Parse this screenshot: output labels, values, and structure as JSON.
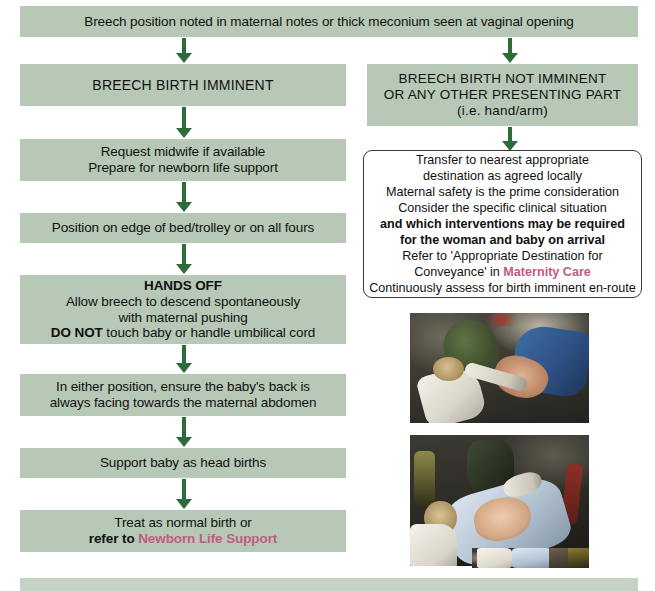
{
  "colors": {
    "box_fill": "#b7c9b6",
    "arrow": "#2f6b3a",
    "highlight_pink": "#bf5c84",
    "panel_border": "#3a3a3a",
    "text": "#101010"
  },
  "flow": {
    "start_box": {
      "lines": [
        "Breech position noted in maternal notes or thick meconium seen at vaginal opening"
      ]
    },
    "left_branch": {
      "header": {
        "lines": [
          "BREECH BIRTH IMMINENT"
        ]
      },
      "steps": [
        {
          "lines": [
            "Request midwife if available",
            "Prepare for newborn life support"
          ]
        },
        {
          "lines": [
            "Position on edge of bed/trolley or on all fours"
          ]
        },
        {
          "lines": [
            "HANDS OFF",
            "Allow breech to descend spontaneously",
            "with maternal pushing",
            "DO NOT touch baby or handle umbilical cord"
          ]
        },
        {
          "lines": [
            "In either position, ensure the baby's back is",
            "always facing towards the maternal abdomen"
          ]
        },
        {
          "lines": [
            "Support baby as head births"
          ]
        },
        {
          "lines": [
            "Treat as normal birth or",
            "refer to Newborn Life Support"
          ]
        }
      ],
      "hands_off_bold": "HANDS OFF",
      "do_not_bold": "DO NOT",
      "refer_to_bold": "refer to",
      "newborn_life_support_link": "Newborn Life Support"
    },
    "right_branch": {
      "header": {
        "lines": [
          "BREECH BIRTH NOT IMMINENT",
          "OR ANY OTHER PRESENTING PART",
          "(i.e. hand/arm)"
        ]
      },
      "advisory_panel": {
        "lines": [
          "Transfer to nearest appropriate",
          "destination as agreed locally",
          "Maternal safety is the prime consideration",
          "Consider the specific clinical situation",
          "and which interventions may be required",
          "for the woman and baby on arrival",
          "Refer to 'Appropriate Destination for",
          "Conveyance' in Maternity Care",
          "Continuously assess for birth imminent en-route"
        ],
        "bold_lines": [
          "and which interventions may be required",
          "for the woman and baby on arrival"
        ],
        "refer_line_prefix": "Refer to 'Appropriate Destination for",
        "conveyance_prefix": "Conveyance' in ",
        "maternity_care_link": "Maternity Care"
      }
    },
    "footer_box": {
      "lines": [
        ""
      ]
    }
  },
  "photos": [
    {
      "caption_alt": "Paramedics assisting a breech birth inside an ambulance"
    },
    {
      "caption_alt": "Newborn on a stretcher being attended to by crew"
    },
    {
      "caption_alt": "Clinical scene partially cut off at the bottom of the page"
    }
  ]
}
